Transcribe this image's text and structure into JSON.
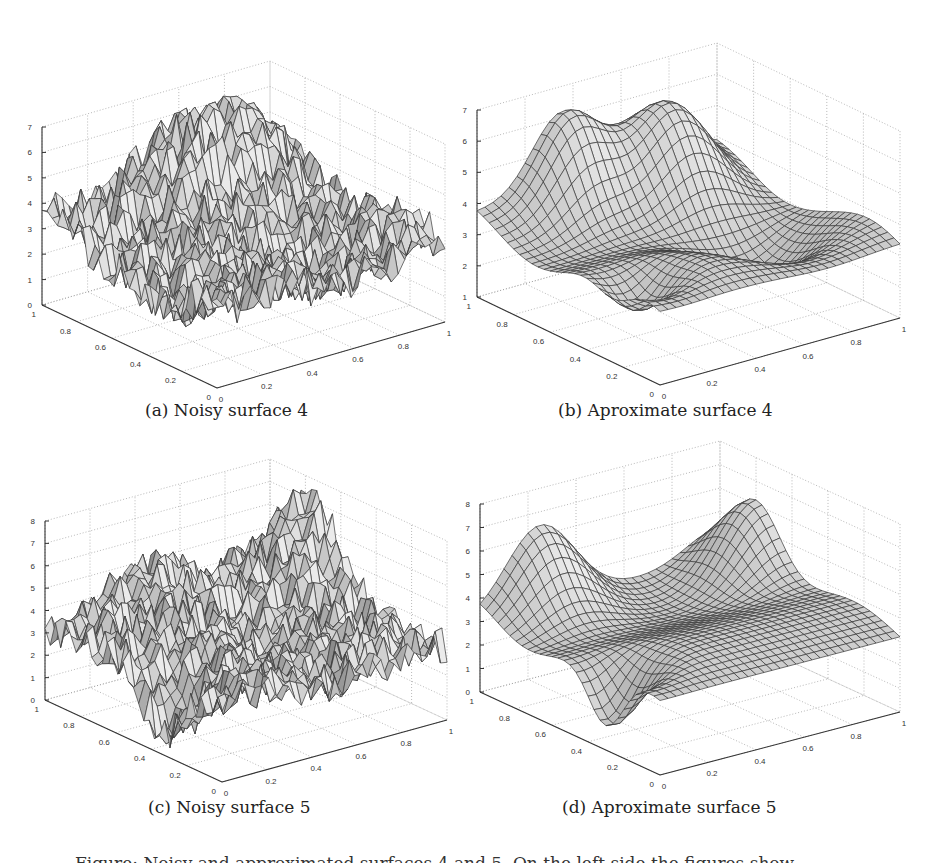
{
  "figure": {
    "panels": [
      {
        "id": "a",
        "caption": "(a) Noisy surface 4",
        "zlim": [
          0,
          7
        ],
        "zticks": [
          "0",
          "1",
          "2",
          "3",
          "4",
          "5",
          "6",
          "7"
        ],
        "xticks": [
          "0",
          "0.2",
          "0.4",
          "0.6",
          "0.8",
          "1"
        ],
        "yticks": [
          "0",
          "0.2",
          "0.4",
          "0.6",
          "0.8",
          "1"
        ],
        "style": "noisy"
      },
      {
        "id": "b",
        "caption": "(b) Aproximate surface 4",
        "zlim": [
          1,
          7
        ],
        "zticks": [
          "1",
          "2",
          "3",
          "4",
          "5",
          "6",
          "7"
        ],
        "xticks": [
          "0",
          "0.2",
          "0.4",
          "0.6",
          "0.8",
          "1"
        ],
        "yticks": [
          "0",
          "0.2",
          "0.4",
          "0.6",
          "0.8",
          "1"
        ],
        "style": "smooth"
      },
      {
        "id": "c",
        "caption": "(c) Noisy surface 5",
        "zlim": [
          0,
          8
        ],
        "zticks": [
          "0",
          "1",
          "2",
          "3",
          "4",
          "5",
          "6",
          "7",
          "8"
        ],
        "xticks": [
          "0",
          "0.2",
          "0.4",
          "0.6",
          "0.8",
          "1"
        ],
        "yticks": [
          "0",
          "0.2",
          "0.4",
          "0.6",
          "0.8",
          "1"
        ],
        "style": "noisy"
      },
      {
        "id": "d",
        "caption": "(d) Aproximate surface 5",
        "zlim": [
          0,
          8
        ],
        "zticks": [
          "0",
          "1",
          "2",
          "3",
          "4",
          "5",
          "6",
          "7",
          "8"
        ],
        "xticks": [
          "0",
          "0.2",
          "0.4",
          "0.6",
          "0.8",
          "1"
        ],
        "yticks": [
          "0",
          "0.2",
          "0.4",
          "0.6",
          "0.8",
          "1"
        ],
        "style": "smooth"
      }
    ],
    "bottom_text": "Figure: Noisy and approximated surfaces 4 and 5. On the left side the figures show"
  },
  "chart_data": [
    {
      "type": "surface3d",
      "title": "(a) Noisy surface 4",
      "xlabel": "",
      "ylabel": "",
      "zlabel": "",
      "xlim": [
        0,
        1
      ],
      "ylim": [
        0,
        1
      ],
      "zlim": [
        0,
        7
      ],
      "grid": true,
      "description": "Noisy mesh surface, values roughly 0.5-6.8, peaks near back center (~6.5-6.8), dips near front (~0.5)"
    },
    {
      "type": "surface3d",
      "title": "(b) Aproximate surface 4",
      "xlim": [
        0,
        1
      ],
      "ylim": [
        0,
        1
      ],
      "zlim": [
        1,
        7
      ],
      "grid": true,
      "description": "Smooth wavy surface fitted to (a), ranges ~1.3 to ~6.8, two peaks at back"
    },
    {
      "type": "surface3d",
      "title": "(c) Noisy surface 5",
      "xlim": [
        0,
        1
      ],
      "ylim": [
        0,
        1
      ],
      "zlim": [
        0,
        8
      ],
      "grid": true,
      "description": "Noisy mesh surface, values ~0.5-7.5, high peak near right corner (~7.5), deep dip front-left (~0.3)"
    },
    {
      "type": "surface3d",
      "title": "(d) Aproximate surface 5",
      "xlim": [
        0,
        1
      ],
      "ylim": [
        0,
        1
      ],
      "zlim": [
        0,
        8
      ],
      "grid": true,
      "description": "Smooth saddle-like surface, ~0.3 to ~7.2, peaks at back-center and right corner"
    }
  ]
}
